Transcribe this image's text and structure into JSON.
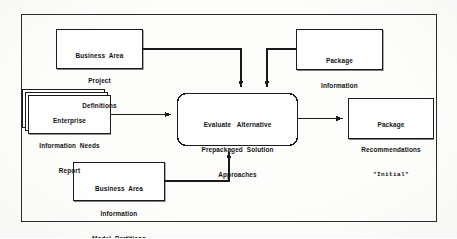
{
  "diagram": {
    "type": "data-flow-diagram",
    "title": "Evaluate Alternative Prepackaged Solution Approaches",
    "frame": {
      "name": "diagram-border"
    },
    "colors": {
      "stroke": "#1a1a1a",
      "text": "#121212",
      "background": "#fdfdfc",
      "box_fill": "#ffffff"
    },
    "nodes": [
      {
        "id": "business-area-project-definitions",
        "shape": "rectangle",
        "role": "input-store",
        "lines": [
          "Business  Area",
          "Project",
          "Definitions"
        ]
      },
      {
        "id": "package-information",
        "shape": "rectangle",
        "role": "input-store",
        "lines": [
          "Package",
          "Information"
        ]
      },
      {
        "id": "enterprise-information-needs-report",
        "shape": "stacked-rectangle",
        "role": "input-document",
        "stack_count": 3,
        "lines": [
          "Enterprise",
          "Information  Needs",
          "Report"
        ]
      },
      {
        "id": "evaluate-alternative-prepackaged-solution-approaches",
        "shape": "rounded-rectangle",
        "role": "process",
        "lines": [
          "Evaluate   Alternative",
          "Prepackaged  Solution",
          "Approaches"
        ]
      },
      {
        "id": "business-area-information-model-partitions",
        "shape": "rectangle",
        "role": "input-store",
        "lines": [
          "Business  Area",
          "Information",
          "Model  Partitions"
        ]
      },
      {
        "id": "package-recommendations-initial",
        "shape": "rectangle",
        "role": "output-store",
        "lines": [
          "Package",
          "Recommendations"
        ],
        "quoted_line": "\"Initial\""
      }
    ],
    "flows": [
      {
        "id": "flow-project-definitions-to-process",
        "from": "business-area-project-definitions",
        "to": "evaluate-alternative-prepackaged-solution-approaches",
        "routing": "right-then-down",
        "arrowhead": "down"
      },
      {
        "id": "flow-package-information-to-process",
        "from": "package-information",
        "to": "evaluate-alternative-prepackaged-solution-approaches",
        "routing": "left-then-down",
        "arrowhead": "down"
      },
      {
        "id": "flow-enterprise-report-to-process",
        "from": "enterprise-information-needs-report",
        "to": "evaluate-alternative-prepackaged-solution-approaches",
        "routing": "straight-right",
        "arrowhead": "right"
      },
      {
        "id": "flow-model-partitions-to-process",
        "from": "business-area-information-model-partitions",
        "to": "evaluate-alternative-prepackaged-solution-approaches",
        "routing": "right-then-up",
        "arrowhead": "up"
      },
      {
        "id": "flow-process-to-package-recommendations",
        "from": "evaluate-alternative-prepackaged-solution-approaches",
        "to": "package-recommendations-initial",
        "routing": "straight-right",
        "arrowhead": "right"
      }
    ]
  }
}
